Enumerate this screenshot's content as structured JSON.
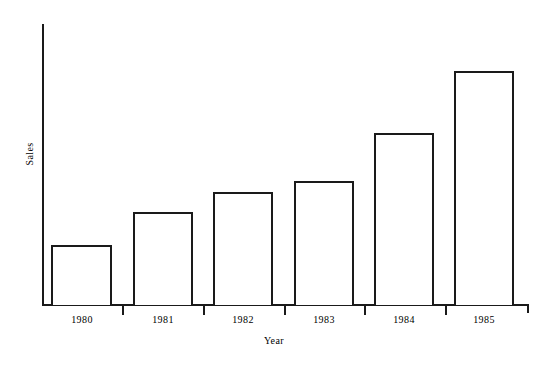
{
  "chart_data": {
    "type": "bar",
    "title": "",
    "subtitle": "",
    "xlabel": "Year",
    "ylabel": "Sales",
    "categories": [
      "1980",
      "1981",
      "1982",
      "1983",
      "1984",
      "1985"
    ],
    "values": [
      26,
      40,
      48,
      53,
      73,
      100
    ],
    "value_units": "relative (1985 = 100)",
    "ylim": [
      0,
      120
    ],
    "xlim": [
      0,
      6
    ],
    "grid": false,
    "legend": null,
    "legend_position": "none",
    "y_tick_labels": [],
    "x_tick_labels": [
      "1980",
      "1981",
      "1982",
      "1983",
      "1984",
      "1985"
    ],
    "annotations": [],
    "series": [
      {
        "name": "Sales",
        "values": [
          26,
          40,
          48,
          53,
          73,
          100
        ],
        "fill_color": "#ffffff",
        "edge_color": "#1a1a1a"
      }
    ],
    "style": {
      "bar_fill": "#ffffff",
      "bar_edge": "#1a1a1a",
      "axis_color": "#1a1a1a",
      "background": "#ffffff",
      "text_color": "#000000"
    }
  },
  "axes": {
    "y_axis_label": "Sales",
    "x_axis_label": "Year"
  },
  "bars": [
    {
      "category": "1980",
      "value": 26,
      "left": 51,
      "width": 61,
      "top": 245,
      "height": 60,
      "tick_left": 122
    },
    {
      "category": "1981",
      "value": 40,
      "left": 133,
      "width": 60,
      "top": 212,
      "height": 93,
      "tick_left": 203
    },
    {
      "category": "1982",
      "value": 48,
      "left": 213,
      "width": 60,
      "top": 192,
      "height": 113,
      "tick_left": 284
    },
    {
      "category": "1983",
      "value": 53,
      "left": 294,
      "width": 60,
      "top": 181,
      "height": 124,
      "tick_left": 364
    },
    {
      "category": "1984",
      "value": 73,
      "left": 374,
      "width": 60,
      "top": 133,
      "height": 172,
      "tick_left": 445
    },
    {
      "category": "1985",
      "value": 100,
      "left": 454,
      "width": 60,
      "top": 71,
      "height": 234,
      "tick_left": 527
    }
  ],
  "tick_labels": [
    {
      "text": "1980",
      "left": 42
    },
    {
      "text": "1981",
      "left": 123
    },
    {
      "text": "1982",
      "left": 203
    },
    {
      "text": "1983",
      "left": 284
    },
    {
      "text": "1984",
      "left": 364
    },
    {
      "text": "1985",
      "left": 444
    }
  ]
}
